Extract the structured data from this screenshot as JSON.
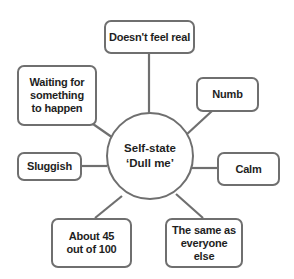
{
  "diagram": {
    "type": "mind-map",
    "center": {
      "line1": "Self-state",
      "line2": "‘Dull me’"
    },
    "nodes": [
      {
        "id": "top",
        "label": "Doesn't feel real"
      },
      {
        "id": "upper-left",
        "label": "Waiting for something to happen"
      },
      {
        "id": "upper-right",
        "label": "Numb"
      },
      {
        "id": "left",
        "label": "Sluggish"
      },
      {
        "id": "right",
        "label": "Calm"
      },
      {
        "id": "lower-left",
        "label": "About 45 out of 100"
      },
      {
        "id": "lower-right",
        "label": "The same as everyone else"
      }
    ],
    "colors": {
      "stroke": "#6f6f6f",
      "text": "#1e1e1e",
      "background": "#ffffff"
    }
  }
}
